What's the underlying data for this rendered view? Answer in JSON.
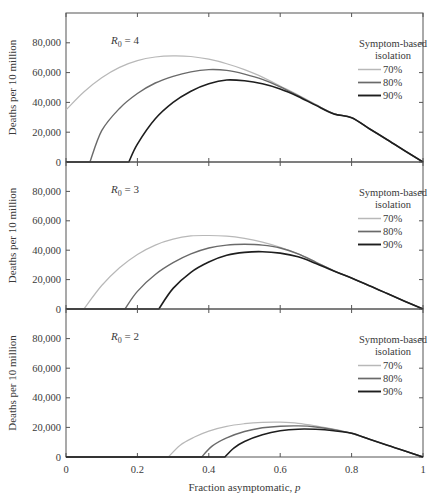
{
  "chart_data": [
    {
      "type": "line",
      "panel": "top",
      "annotation": "R0 = 4",
      "annotation_base": "R",
      "annotation_sub": "0",
      "annotation_rest": " = 4",
      "xlabel": "Fraction asymptomatic, p",
      "ylabel": "Deaths per 10 million",
      "xlim": [
        0,
        1
      ],
      "ylim": [
        0,
        100000
      ],
      "xticks": [
        0,
        0.2,
        0.4,
        0.6,
        0.8,
        1
      ],
      "yticks": [
        0,
        20000,
        40000,
        60000,
        80000
      ],
      "ytick_labels": [
        "0",
        "20,000",
        "40,000",
        "60,000",
        "80,000"
      ],
      "grid": false,
      "legend_title": [
        "Symptom-based",
        "isolation"
      ],
      "legend_position": "upper right",
      "series": [
        {
          "name": "70%",
          "color": "#b8b8b8",
          "width": 1.2,
          "x": [
            0,
            0.05,
            0.1,
            0.15,
            0.2,
            0.25,
            0.3,
            0.35,
            0.4,
            0.45,
            0.5,
            0.55,
            0.6,
            0.65,
            0.7,
            0.75,
            0.8,
            0.85,
            0.9,
            0.95,
            1.0
          ],
          "y": [
            35000,
            47000,
            56500,
            63500,
            68000,
            70500,
            71300,
            70800,
            69000,
            66000,
            62000,
            57000,
            51000,
            45000,
            38500,
            32500,
            29700,
            22300,
            14900,
            7400,
            0
          ]
        },
        {
          "name": "80%",
          "color": "#6a6a6a",
          "width": 1.4,
          "x": [
            0,
            0.067,
            0.1,
            0.15,
            0.2,
            0.25,
            0.3,
            0.35,
            0.4,
            0.45,
            0.5,
            0.55,
            0.6,
            0.65,
            0.7,
            0.75,
            0.8,
            0.85,
            0.9,
            0.95,
            1.0
          ],
          "y": [
            0,
            0,
            21000,
            36000,
            46000,
            53000,
            57500,
            60500,
            62000,
            61500,
            59000,
            55500,
            50500,
            44500,
            38300,
            32400,
            29700,
            22300,
            14900,
            7400,
            0
          ]
        },
        {
          "name": "90%",
          "color": "#1e1e1e",
          "width": 1.6,
          "x": [
            0,
            0.176,
            0.2,
            0.25,
            0.3,
            0.35,
            0.4,
            0.45,
            0.5,
            0.55,
            0.6,
            0.65,
            0.7,
            0.75,
            0.8,
            0.85,
            0.9,
            0.95,
            1.0
          ],
          "y": [
            0,
            0,
            12000,
            29000,
            40000,
            47500,
            52500,
            55000,
            54500,
            52500,
            49000,
            44000,
            38000,
            32300,
            29700,
            22300,
            14900,
            7400,
            0
          ]
        }
      ]
    },
    {
      "type": "line",
      "panel": "middle",
      "annotation": "R0 = 3",
      "annotation_base": "R",
      "annotation_sub": "0",
      "annotation_rest": " = 3",
      "xlabel": "Fraction asymptomatic, p",
      "ylabel": "Deaths per 10 million",
      "xlim": [
        0,
        1
      ],
      "ylim": [
        0,
        100000
      ],
      "xticks": [
        0,
        0.2,
        0.4,
        0.6,
        0.8,
        1
      ],
      "yticks": [
        0,
        20000,
        40000,
        60000,
        80000
      ],
      "ytick_labels": [
        "0",
        "20,000",
        "40,000",
        "60,000",
        "80,000"
      ],
      "grid": false,
      "legend_title": [
        "Symptom-based",
        "isolation"
      ],
      "legend_position": "upper right",
      "series": [
        {
          "name": "70%",
          "color": "#b8b8b8",
          "width": 1.2,
          "x": [
            0,
            0.05,
            0.1,
            0.15,
            0.2,
            0.25,
            0.3,
            0.35,
            0.4,
            0.45,
            0.5,
            0.55,
            0.6,
            0.65,
            0.7,
            0.75,
            0.8,
            0.85,
            0.9,
            0.95,
            1.0
          ],
          "y": [
            0,
            0,
            16000,
            28000,
            37000,
            43500,
            47500,
            49700,
            50000,
            49500,
            48000,
            45500,
            42000,
            37500,
            32000,
            26000,
            21000,
            15800,
            10500,
            5200,
            0
          ]
        },
        {
          "name": "80%",
          "color": "#6a6a6a",
          "width": 1.4,
          "x": [
            0,
            0.165,
            0.2,
            0.25,
            0.3,
            0.35,
            0.4,
            0.45,
            0.5,
            0.55,
            0.6,
            0.65,
            0.7,
            0.75,
            0.8,
            0.85,
            0.9,
            0.95,
            1.0
          ],
          "y": [
            0,
            0,
            12000,
            23500,
            31500,
            37500,
            41500,
            43500,
            44000,
            43500,
            41500,
            37500,
            31800,
            26000,
            21000,
            15800,
            10500,
            5200,
            0
          ]
        },
        {
          "name": "90%",
          "color": "#1e1e1e",
          "width": 1.6,
          "x": [
            0,
            0.26,
            0.3,
            0.35,
            0.4,
            0.45,
            0.5,
            0.55,
            0.6,
            0.65,
            0.7,
            0.75,
            0.8,
            0.85,
            0.9,
            0.95,
            1.0
          ],
          "y": [
            0,
            0,
            14000,
            25000,
            32000,
            36500,
            38500,
            39000,
            38000,
            35500,
            31000,
            25800,
            21000,
            15800,
            10500,
            5200,
            0
          ]
        }
      ]
    },
    {
      "type": "line",
      "panel": "bottom",
      "annotation": "R0 = 2",
      "annotation_base": "R",
      "annotation_sub": "0",
      "annotation_rest": " = 2",
      "xlabel": "Fraction asymptomatic, p",
      "ylabel": "Deaths per 10 million",
      "xlim": [
        0,
        1
      ],
      "ylim": [
        0,
        100000
      ],
      "xticks": [
        0,
        0.2,
        0.4,
        0.6,
        0.8,
        1
      ],
      "xtick_labels": [
        "0",
        "0.2",
        "0.4",
        "0.6",
        "0.8",
        "1"
      ],
      "yticks": [
        0,
        20000,
        40000,
        60000,
        80000
      ],
      "ytick_labels": [
        "0",
        "20,000",
        "40,000",
        "60,000",
        "80,000"
      ],
      "grid": false,
      "legend_title": [
        "Symptom-based",
        "isolation"
      ],
      "legend_position": "upper right",
      "series": [
        {
          "name": "70%",
          "color": "#b8b8b8",
          "width": 1.2,
          "x": [
            0,
            0.287,
            0.32,
            0.36,
            0.4,
            0.45,
            0.5,
            0.55,
            0.6,
            0.65,
            0.7,
            0.75,
            0.8,
            0.85,
            0.9,
            0.95,
            1.0
          ],
          "y": [
            0,
            0,
            8000,
            13500,
            17500,
            20700,
            22500,
            23400,
            23500,
            22800,
            21000,
            18800,
            16000,
            12000,
            8000,
            4000,
            0
          ]
        },
        {
          "name": "80%",
          "color": "#6a6a6a",
          "width": 1.4,
          "x": [
            0,
            0.38,
            0.41,
            0.45,
            0.5,
            0.55,
            0.6,
            0.65,
            0.7,
            0.75,
            0.8,
            0.85,
            0.9,
            0.95,
            1.0
          ],
          "y": [
            0,
            0,
            7500,
            13000,
            17200,
            19700,
            20800,
            21000,
            20300,
            18500,
            16000,
            12000,
            8000,
            4000,
            0
          ]
        },
        {
          "name": "90%",
          "color": "#1e1e1e",
          "width": 1.6,
          "x": [
            0,
            0.445,
            0.47,
            0.5,
            0.55,
            0.6,
            0.65,
            0.7,
            0.75,
            0.8,
            0.85,
            0.9,
            0.95,
            1.0
          ],
          "y": [
            0,
            0,
            6000,
            10500,
            15000,
            17700,
            18800,
            18700,
            17700,
            16000,
            12000,
            8000,
            4000,
            0
          ]
        }
      ]
    }
  ],
  "layout": {
    "plot_left": 66,
    "plot_right": 423,
    "panels": [
      {
        "top": 13,
        "baseline": 162
      },
      {
        "top": 162,
        "baseline": 309
      },
      {
        "top": 309,
        "baseline": 457
      }
    ]
  },
  "labels": {
    "x_axis_title": "Fraction asymptomatic,",
    "x_axis_var": "p",
    "y_axis_title": "Deaths per 10 million",
    "legend_title_line1": "Symptom-based",
    "legend_title_line2": "isolation"
  }
}
